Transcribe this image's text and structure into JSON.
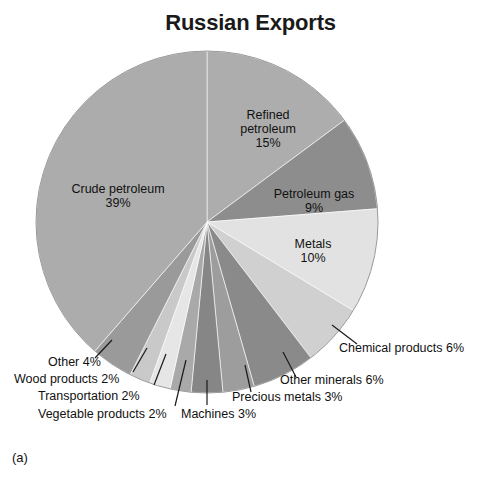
{
  "figure": {
    "title": "Russian Exports",
    "caption": "(a)"
  },
  "chart_data": {
    "type": "pie",
    "title": "Russian Exports",
    "xlabel": "",
    "ylabel": "",
    "units": "percent",
    "start_angle_deg": 0,
    "direction": "clockwise",
    "legend": "none",
    "grid": false,
    "categories": [
      "Refined petroleum",
      "Petroleum gas",
      "Metals",
      "Chemical products",
      "Other minerals",
      "Precious metals",
      "Machines",
      "Vegetable products",
      "Transportation",
      "Wood products",
      "Other",
      "Crude petroleum"
    ],
    "values": [
      15,
      9,
      10,
      6,
      6,
      3,
      3,
      2,
      2,
      2,
      4,
      39
    ],
    "colors": [
      "#adadad",
      "#8d8d8d",
      "#e2e2e2",
      "#d0d0d0",
      "#8a8a8a",
      "#9d9d9d",
      "#868686",
      "#a9a9a9",
      "#e6e6e6",
      "#c9c9c9",
      "#9a9a9a",
      "#acacac"
    ],
    "slices": [
      {
        "label": "Refined petroleum",
        "value": 15,
        "value_text": "15%",
        "color": "#adadad",
        "label_placement": "inside"
      },
      {
        "label": "Petroleum gas",
        "value": 9,
        "value_text": "9%",
        "color": "#8d8d8d",
        "label_placement": "inside"
      },
      {
        "label": "Metals",
        "value": 10,
        "value_text": "10%",
        "color": "#e2e2e2",
        "label_placement": "inside"
      },
      {
        "label": "Chemical products",
        "value": 6,
        "value_text": "6%",
        "color": "#d0d0d0",
        "label_placement": "callout"
      },
      {
        "label": "Other minerals",
        "value": 6,
        "value_text": "6%",
        "color": "#8a8a8a",
        "label_placement": "callout"
      },
      {
        "label": "Precious metals",
        "value": 3,
        "value_text": "3%",
        "color": "#9d9d9d",
        "label_placement": "callout"
      },
      {
        "label": "Machines",
        "value": 3,
        "value_text": "3%",
        "color": "#868686",
        "label_placement": "callout"
      },
      {
        "label": "Vegetable products",
        "value": 2,
        "value_text": "2%",
        "color": "#a9a9a9",
        "label_placement": "callout"
      },
      {
        "label": "Transportation",
        "value": 2,
        "value_text": "2%",
        "color": "#e6e6e6",
        "label_placement": "callout"
      },
      {
        "label": "Wood products",
        "value": 2,
        "value_text": "2%",
        "color": "#c9c9c9",
        "label_placement": "callout"
      },
      {
        "label": "Other",
        "value": 4,
        "value_text": "4%",
        "color": "#9a9a9a",
        "label_placement": "callout"
      },
      {
        "label": "Crude petroleum",
        "value": 39,
        "value_text": "39%",
        "color": "#acacac",
        "label_placement": "inside"
      }
    ]
  },
  "inside_labels": {
    "crude_petroleum": {
      "name": "Crude petroleum",
      "value_text": "39%"
    },
    "refined_petroleum_line1": "Refined",
    "refined_petroleum_line2": "petroleum",
    "refined_petroleum_value": "15%",
    "petroleum_gas": {
      "name": "Petroleum gas",
      "value_text": "9%"
    },
    "metals": {
      "name": "Metals",
      "value_text": "10%"
    }
  },
  "callout_labels": {
    "chemical_products": "Chemical products 6%",
    "other_minerals": "Other minerals 6%",
    "precious_metals": "Precious metals 3%",
    "machines": "Machines 3%",
    "vegetable_products": "Vegetable products 2%",
    "transportation": "Transportation 2%",
    "wood_products": "Wood products 2%",
    "other": "Other 4%"
  }
}
